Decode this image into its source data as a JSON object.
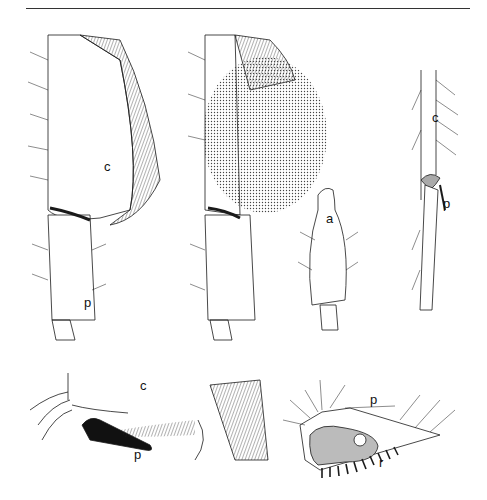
{
  "figure": {
    "header_rule": true,
    "panels": [
      {
        "id": "A",
        "description": "hind leg, corbicula side view",
        "labels": [
          {
            "text": "c",
            "x": 104,
            "y": 160
          },
          {
            "text": "p",
            "x": 84,
            "y": 296
          }
        ]
      },
      {
        "id": "B",
        "description": "hind leg with pollen load (stippled)",
        "labels": []
      },
      {
        "id": "C",
        "description": "basitarsus detail",
        "labels": [
          {
            "text": "a",
            "x": 326,
            "y": 212
          }
        ]
      },
      {
        "id": "D",
        "description": "hind leg narrow lateral view",
        "labels": [
          {
            "text": "c",
            "x": 432,
            "y": 111
          },
          {
            "text": "p",
            "x": 443,
            "y": 197
          }
        ]
      },
      {
        "id": "E",
        "description": "pollen press detail",
        "labels": [
          {
            "text": "c",
            "x": 140,
            "y": 379
          },
          {
            "text": "p",
            "x": 134,
            "y": 448
          }
        ]
      },
      {
        "id": "F",
        "description": "basitarsus with rastellum",
        "labels": [
          {
            "text": "p",
            "x": 370,
            "y": 393
          },
          {
            "text": "r",
            "x": 379,
            "y": 456
          }
        ]
      }
    ],
    "colors": {
      "ink": "#1a1a1a",
      "stipple": "#555555",
      "shade": "#bbbbbb"
    }
  }
}
